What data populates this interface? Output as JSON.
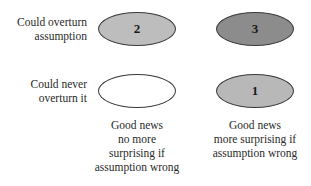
{
  "rows": [
    {
      "label": "Could overturn\nassumption"
    },
    {
      "label": "Could never\noverturn it"
    }
  ],
  "columns": [
    {
      "label": "Good news\nno more\nsurprising if\nassumption wrong"
    },
    {
      "label": "Good news\nmore surprising if\nassumption wrong"
    }
  ],
  "cells": [
    {
      "id": "top-left",
      "value": "2",
      "fill": "#bdbdbd"
    },
    {
      "id": "top-right",
      "value": "3",
      "fill": "#8c8c8c"
    },
    {
      "id": "bottom-left",
      "value": "",
      "fill": "#ffffff"
    },
    {
      "id": "bottom-right",
      "value": "1",
      "fill": "#b8b8b8"
    }
  ]
}
